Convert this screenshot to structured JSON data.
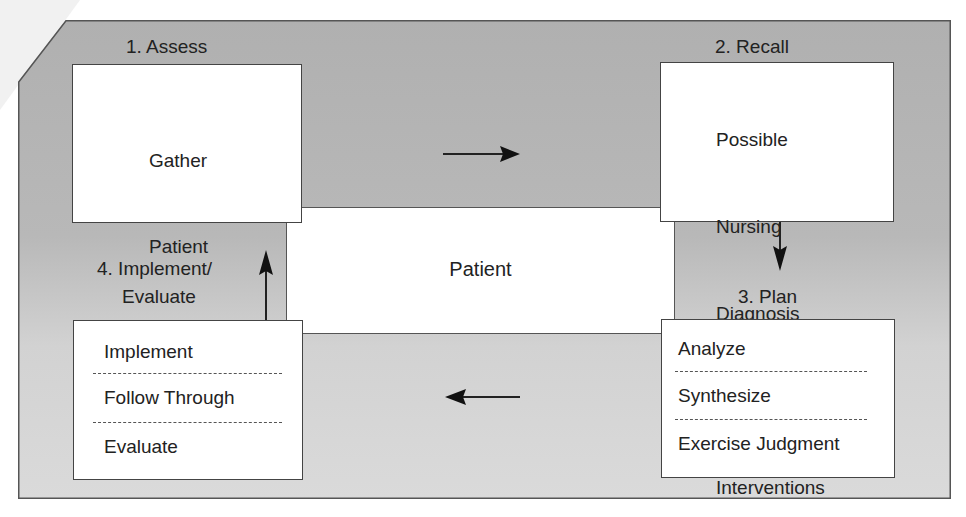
{
  "diagram": {
    "type": "nursing-process-cycle",
    "colors": {
      "panel_gray_top": "#b0b0b0",
      "panel_gray_bottom": "#dadada",
      "box_fill": "#ffffff",
      "stroke": "#444444",
      "text": "#222222"
    },
    "center": {
      "label": "Patient"
    },
    "steps": [
      {
        "id": "assess",
        "label": "1. Assess",
        "lines": [
          "Gather",
          "Patient",
          "Data"
        ]
      },
      {
        "id": "recall",
        "label": "2. Recall",
        "lines": [
          "Possible",
          "Nursing",
          "Diagnosis",
          "  and",
          "Interventions"
        ]
      },
      {
        "id": "plan",
        "label": "3. Plan",
        "sections": [
          "Analyze",
          "Synthesize",
          "Exercise Judgment"
        ]
      },
      {
        "id": "implement",
        "label_line1": "4. Implement/",
        "label_line2": "Evaluate",
        "sections": [
          "Implement",
          "Follow Through",
          "Evaluate"
        ]
      }
    ],
    "arrows": [
      {
        "from": "assess",
        "to": "recall",
        "direction": "right"
      },
      {
        "from": "recall",
        "to": "plan",
        "direction": "down"
      },
      {
        "from": "plan",
        "to": "implement",
        "direction": "left"
      },
      {
        "from": "implement",
        "to": "assess",
        "direction": "up"
      }
    ]
  }
}
